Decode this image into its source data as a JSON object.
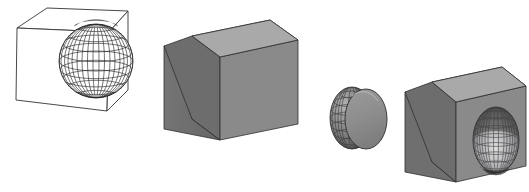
{
  "scene": {
    "title": "Constructive Solid Geometry boolean operation sequence",
    "background_color": "#ffffff",
    "width": 529,
    "height": 192,
    "figure_count": 4
  },
  "palette": {
    "outline": "#1a1a1a",
    "wireframe_line": "#2b2b2b",
    "wireframe_fill": "#ffffff",
    "cube_top": "#a9a9a9",
    "cube_left": "#6e6e6e",
    "cube_right": "#8a8a8a",
    "sphere_light": "#e2e2e2",
    "sphere_mid": "#a5a5a5",
    "sphere_dark": "#5d5d5d",
    "cavity_dark": "#5a5a5a",
    "cavity_light": "#dcdcdc",
    "disc_face": "#8d8d8d"
  },
  "figures": [
    {
      "index": 1,
      "name": "wireframe-cube-and-sphere",
      "label": "Wireframe cube with wireframe sphere",
      "operands": [
        "cube",
        "sphere"
      ],
      "render_style": "wireframe",
      "fill": "#ffffff",
      "sphere": {
        "parallels": 9,
        "meridians": 12,
        "shaded": false
      }
    },
    {
      "index": 2,
      "name": "union-cube-sphere",
      "label": "Solid cube with protruding gridded sphere",
      "operands": [
        "cube",
        "sphere"
      ],
      "operation": "union",
      "render_style": "shaded",
      "sphere": {
        "parallels": 8,
        "meridians": 11,
        "shaded": true
      }
    },
    {
      "index": 3,
      "name": "sliced-sphere-piece",
      "label": "Sphere cut by a plane showing flat disc face",
      "operands": [
        "sphere",
        "half-space"
      ],
      "operation": "intersection",
      "render_style": "shaded",
      "sphere": {
        "parallels": 8,
        "meridians": 8,
        "shaded": true
      }
    },
    {
      "index": 4,
      "name": "difference-cube-minus-sphere",
      "label": "Solid cube with spherical cavity carved into face",
      "operands": [
        "cube",
        "sphere"
      ],
      "operation": "difference",
      "render_style": "shaded",
      "cavity": {
        "parallels": 9,
        "meridians": 9,
        "shaded": true
      }
    }
  ]
}
